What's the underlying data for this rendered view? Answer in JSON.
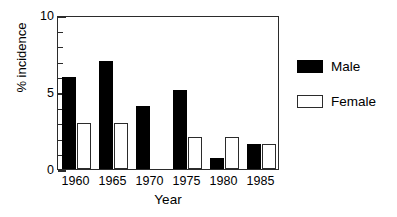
{
  "chart_data": {
    "type": "bar",
    "title": "",
    "xlabel": "Year",
    "ylabel": "% incidence",
    "categories": [
      "1960",
      "1965",
      "1970",
      "1975",
      "1980",
      "1985"
    ],
    "series": [
      {
        "name": "Male",
        "color": "#000000",
        "fill": "solid",
        "values": [
          6.0,
          7.0,
          4.1,
          5.1,
          0.7,
          1.6
        ]
      },
      {
        "name": "Female",
        "color": "#ffffff",
        "fill": "hollow",
        "values": [
          3.0,
          3.0,
          0.0,
          2.1,
          2.1,
          1.6
        ]
      }
    ],
    "ylim": [
      0,
      10
    ],
    "ytick_major": [
      "0",
      "5",
      "10"
    ],
    "ytick_major_values": [
      0,
      5,
      10
    ],
    "ytick_minor_values": [
      1,
      2,
      3,
      4,
      6,
      7,
      8,
      9
    ],
    "grid": false,
    "legend_position": "right",
    "legend": [
      "Male",
      "Female"
    ]
  },
  "legend": {
    "items": [
      {
        "label": "Male",
        "swatch": "filled-black-square"
      },
      {
        "label": "Female",
        "swatch": "open-white-square"
      }
    ]
  }
}
